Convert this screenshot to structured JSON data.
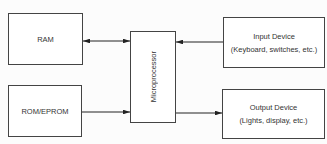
{
  "diagram": {
    "nodes": {
      "ram": {
        "label": "RAM"
      },
      "rom": {
        "label": "ROM/EPROM"
      },
      "cpu": {
        "label": "Microprocessor"
      },
      "input": {
        "label": "Input Device",
        "sublabel": "(Keyboard, switches, etc.)"
      },
      "output": {
        "label": "Output Device",
        "sublabel": "(Lights, display, etc.)"
      }
    },
    "edges": [
      {
        "from": "ram",
        "to": "cpu",
        "direction": "bidirectional"
      },
      {
        "from": "rom",
        "to": "cpu",
        "direction": "one-way"
      },
      {
        "from": "input",
        "to": "cpu",
        "direction": "one-way"
      },
      {
        "from": "cpu",
        "to": "output",
        "direction": "one-way"
      }
    ]
  }
}
